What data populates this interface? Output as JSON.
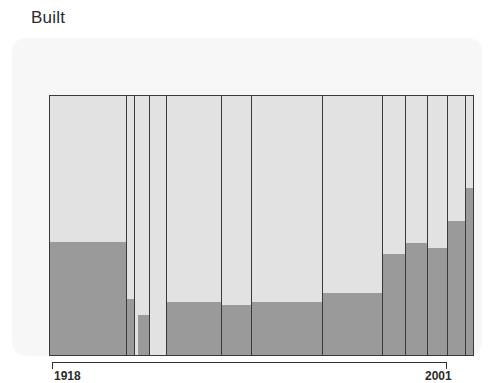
{
  "chart": {
    "title": "Built",
    "background_color": "#f7f7f7",
    "page_background": "#ffffff",
    "axis_color": "#2f2f2f"
  },
  "axis": {
    "start_label": "1918",
    "end_label": "2001"
  },
  "chart_data": {
    "type": "bar",
    "title": "Built",
    "subtitle": "",
    "xlabel": "",
    "ylabel": "",
    "grid": false,
    "legend_position": "none",
    "orientation": "vertical",
    "stacked": true,
    "variable_width": true,
    "note": "Stacked spineplot / mosaic-style bar chart. Each bar spans a year interval (width proportional to group size) and is split into a lower dark-grey proportion and an upper light-grey remainder. Values are proportions (0-1) of each bar filled dark grey.",
    "xlim": [
      1918,
      2001
    ],
    "ylim": [
      0,
      1
    ],
    "colors": {
      "filled": "#9a9a9a",
      "remainder": "#e2e2e2",
      "outline": "#3a3a3a"
    },
    "series": [
      {
        "name": "Filled (dark grey)",
        "color": "#9a9a9a"
      },
      {
        "name": "Remainder (light grey)",
        "color": "#e2e2e2"
      }
    ],
    "categories": [
      "1918",
      "1919",
      "1920",
      "1921",
      "1922",
      "1923",
      "1924",
      "1925",
      "1926",
      "1927",
      "1928",
      "1929",
      "2001"
    ],
    "bars": [
      {
        "index": 1,
        "x_start_pct": 0.0,
        "x_end_pct": 18.12,
        "filled_pct": 43.7
      },
      {
        "index": 2,
        "x_start_pct": 18.12,
        "x_end_pct": 20.0,
        "filled_pct": 21.5
      },
      {
        "index": 3,
        "x_start_pct": 20.71,
        "x_end_pct": 23.76,
        "filled_pct": 15.3
      },
      {
        "index": 4,
        "x_start_pct": 23.76,
        "x_end_pct": 27.76,
        "filled_pct": 0.0
      },
      {
        "index": 5,
        "x_start_pct": 27.76,
        "x_end_pct": 40.71,
        "filled_pct": 20.3
      },
      {
        "index": 6,
        "x_start_pct": 40.71,
        "x_end_pct": 47.76,
        "filled_pct": 19.2
      },
      {
        "index": 7,
        "x_start_pct": 47.76,
        "x_end_pct": 64.47,
        "filled_pct": 20.3
      },
      {
        "index": 8,
        "x_start_pct": 64.47,
        "x_end_pct": 78.82,
        "filled_pct": 24.1
      },
      {
        "index": 9,
        "x_start_pct": 78.82,
        "x_end_pct": 84.24,
        "filled_pct": 39.1
      },
      {
        "index": 10,
        "x_start_pct": 84.24,
        "x_end_pct": 89.41,
        "filled_pct": 43.3
      },
      {
        "index": 11,
        "x_start_pct": 89.41,
        "x_end_pct": 94.12,
        "filled_pct": 41.4
      },
      {
        "index": 12,
        "x_start_pct": 94.12,
        "x_end_pct": 98.35,
        "filled_pct": 51.7
      },
      {
        "index": 13,
        "x_start_pct": 98.35,
        "x_end_pct": 100.0,
        "filled_pct": 64.4
      }
    ]
  }
}
